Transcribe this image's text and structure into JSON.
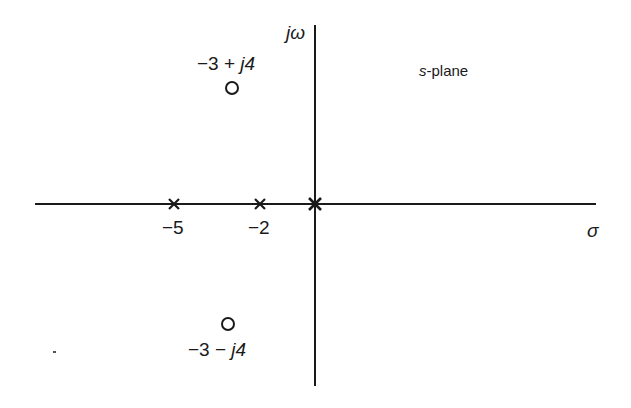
{
  "diagram": {
    "title_var": "s",
    "title_rest": "-plane",
    "axes": {
      "real_label": "σ",
      "imag_label": "jω"
    },
    "poles": [
      {
        "label": "−5",
        "value": -5,
        "marker": "cross"
      },
      {
        "label": "−2",
        "value": -2,
        "marker": "cross"
      },
      {
        "label": "",
        "value": 0,
        "marker": "cross"
      }
    ],
    "zeros": [
      {
        "label_num": "−3 + ",
        "label_imag": "j4",
        "re": -3,
        "im": 4,
        "marker": "circle"
      },
      {
        "label_num": "−3 − ",
        "label_imag": "j4",
        "re": -3,
        "im": -4,
        "marker": "circle"
      }
    ],
    "colors": {
      "ink": "#1a1a1a",
      "background": "#ffffff"
    }
  }
}
